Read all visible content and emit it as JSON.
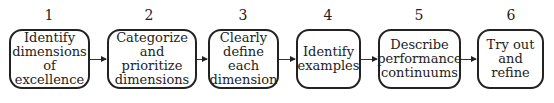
{
  "steps": [
    {
      "number": "1",
      "label": "Identify\ndimensions\nof excellence"
    },
    {
      "number": "2",
      "label": "Categorize\nand prioritize\ndimensions"
    },
    {
      "number": "3",
      "label": "Clearly\ndefine each\ndimension"
    },
    {
      "number": "4",
      "label": "Identify\nexamples"
    },
    {
      "number": "5",
      "label": "Describe\nperformance\ncontinuums"
    },
    {
      "number": "6",
      "label": "Try out\nand refine"
    }
  ]
}
